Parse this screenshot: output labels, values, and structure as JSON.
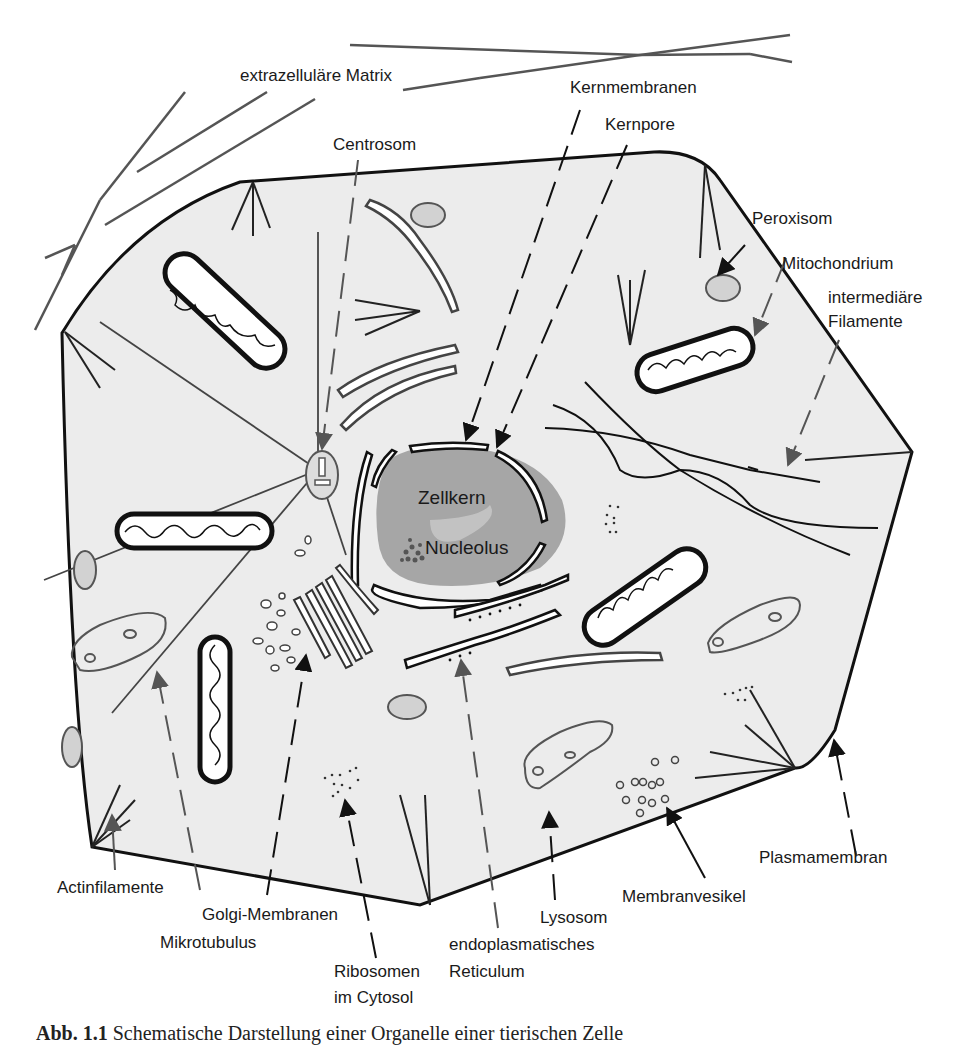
{
  "figure": {
    "type": "schematic cell diagram",
    "colors": {
      "cytoplasm": "#ececec",
      "nucleus": "#a6a6a6",
      "outline": "#111111",
      "filament_gray": "#555555",
      "peroxisome_fill": "#cfcfcf",
      "background": "#ffffff"
    }
  },
  "labels": {
    "extracellular_matrix": "extrazelluläre Matrix",
    "nuclear_membranes": "Kernmembranen",
    "nuclear_pore": "Kernpore",
    "centrosome": "Centrosom",
    "peroxisome": "Peroxisom",
    "mitochondrion": "Mitochondrium",
    "intermediate_filaments_1": "intermediäre",
    "intermediate_filaments_2": "Filamente",
    "nucleus": "Zellkern",
    "nucleolus": "Nucleolus",
    "actin_filaments": "Actinfilamente",
    "golgi_membranes": "Golgi-Membranen",
    "microtubule": "Mikrotubulus",
    "ribosomes_1": "Ribosomen",
    "ribosomes_2": "im Cytosol",
    "er_1": "endoplasmatisches",
    "er_2": "Reticulum",
    "lysosome": "Lysosom",
    "membrane_vesicle": "Membranvesikel",
    "plasma_membrane": "Plasmamembran"
  },
  "caption": {
    "prefix": "Abb. 1.1",
    "text": "Schematische Darstellung einer Organelle einer tierischen Zelle"
  }
}
